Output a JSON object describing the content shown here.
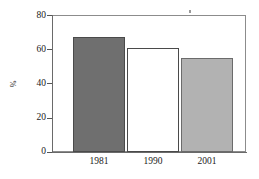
{
  "chart_data": {
    "type": "bar",
    "title": "",
    "subtitle": "",
    "xlabel": "",
    "ylabel": "%",
    "categories": [
      "1981",
      "1990",
      "2001"
    ],
    "values": [
      67,
      61,
      55
    ],
    "series": [
      {
        "name": "",
        "values": [
          67,
          61,
          55
        ]
      }
    ],
    "ylim": [
      0,
      80
    ],
    "yticks": [
      0,
      20,
      40,
      60,
      80
    ],
    "ytick_labels": [
      "0",
      "20",
      "40",
      "60",
      "80"
    ],
    "grid": false,
    "legend": "none",
    "bar_styles": [
      {
        "label": "1981",
        "fill": "#6f6f6f",
        "stroke": "#4a4a4a",
        "style": "dark-gray"
      },
      {
        "label": "1990",
        "fill": "#ffffff",
        "stroke": "#4a4a4a",
        "style": "white-outlined"
      },
      {
        "label": "2001",
        "fill": "#b2b2b2",
        "stroke": "#6b6b6b",
        "style": "light-gray"
      }
    ],
    "frame": "full-box",
    "frame_color": "#8c8c8c",
    "axis_color": "#6a6a6a",
    "background": "#ffffff"
  },
  "axis": {
    "y_title": "%",
    "tick_labels_y": [
      "80",
      "60",
      "40",
      "20",
      "0"
    ],
    "tick_labels_x": [
      "1981",
      "1990",
      "2001"
    ]
  },
  "marks": {
    "artifact": ""
  }
}
